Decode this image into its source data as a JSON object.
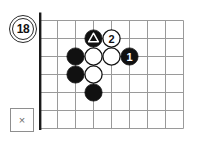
{
  "figure": {
    "number": "18",
    "badge_name": "figure-number-badge"
  },
  "close_box": {
    "glyph": "×"
  },
  "top_artifact": {
    "text": ""
  },
  "board": {
    "cols": 9,
    "rows": 7,
    "cell": 18,
    "line_color": "#9a9a9a",
    "edge_color": "#1a1a1a",
    "edge_width": 2.6,
    "thick_edges": [
      "left",
      "bottom"
    ],
    "black_color": "#111111",
    "white_color": "#ffffff",
    "white_outline": "#111111",
    "stone_radius": 8.6
  },
  "stones": [
    {
      "name": "black-stone-triangle",
      "color": "black",
      "col": 3,
      "row": 1,
      "label": "",
      "marker": "triangle"
    },
    {
      "name": "white-stone-move-2",
      "color": "white",
      "col": 4,
      "row": 1,
      "label": "2",
      "marker": ""
    },
    {
      "name": "black-stone-a",
      "color": "black",
      "col": 2,
      "row": 2,
      "label": "",
      "marker": ""
    },
    {
      "name": "white-stone-a",
      "color": "white",
      "col": 3,
      "row": 2,
      "label": "",
      "marker": ""
    },
    {
      "name": "white-stone-b",
      "color": "white",
      "col": 4,
      "row": 2,
      "label": "",
      "marker": ""
    },
    {
      "name": "black-stone-move-1",
      "color": "black",
      "col": 5,
      "row": 2,
      "label": "1",
      "marker": ""
    },
    {
      "name": "black-stone-b",
      "color": "black",
      "col": 2,
      "row": 3,
      "label": "",
      "marker": ""
    },
    {
      "name": "white-stone-c",
      "color": "white",
      "col": 3,
      "row": 3,
      "label": "",
      "marker": ""
    },
    {
      "name": "black-stone-c",
      "color": "black",
      "col": 3,
      "row": 4,
      "label": "",
      "marker": ""
    }
  ]
}
